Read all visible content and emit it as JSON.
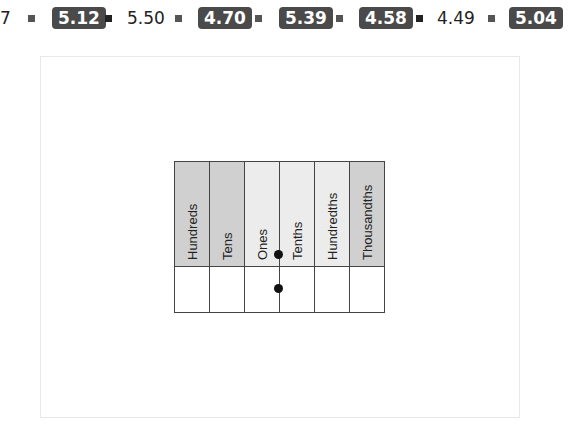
{
  "strip": {
    "cut_char": "7",
    "items": [
      {
        "value": "5.12",
        "style": "badge"
      },
      {
        "value": "5.50",
        "style": "plain"
      },
      {
        "value": "4.70",
        "style": "badge"
      },
      {
        "value": "5.39",
        "style": "badge"
      },
      {
        "value": "4.58",
        "style": "badge"
      },
      {
        "value": "4.49",
        "style": "plain"
      },
      {
        "value": "5.04",
        "style": "badge"
      }
    ]
  },
  "place_value_chart": {
    "columns": [
      "Hundreds",
      "Tens",
      "Ones",
      "Tenths",
      "Hundredths",
      "Thousandths"
    ]
  }
}
